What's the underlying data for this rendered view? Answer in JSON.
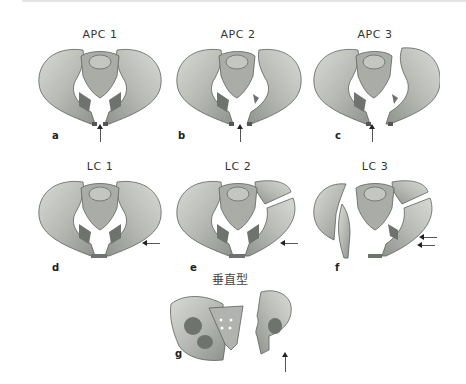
{
  "figure": {
    "panels": [
      {
        "id": "a",
        "title": "APC 1",
        "type": "anteroposterior compression",
        "arrows": "up"
      },
      {
        "id": "b",
        "title": "APC 2",
        "type": "anteroposterior compression",
        "arrows": "up"
      },
      {
        "id": "c",
        "title": "APC 3",
        "type": "anteroposterior compression",
        "arrows": "up"
      },
      {
        "id": "d",
        "title": "LC 1",
        "type": "lateral compression",
        "arrows": "left"
      },
      {
        "id": "e",
        "title": "LC 2",
        "type": "lateral compression",
        "arrows": "left"
      },
      {
        "id": "f",
        "title": "LC 3",
        "type": "lateral compression",
        "arrows": "left-double"
      },
      {
        "id": "g",
        "title": "垂直型",
        "type": "vertical shear",
        "arrows": "up"
      }
    ],
    "colors": {
      "bone": "#b9bcb8",
      "bone_light": "#d6d8d4",
      "bone_dark": "#6f736e",
      "sacrum": "#a7aaa5",
      "arrow": "#222222",
      "text": "#333333"
    }
  }
}
